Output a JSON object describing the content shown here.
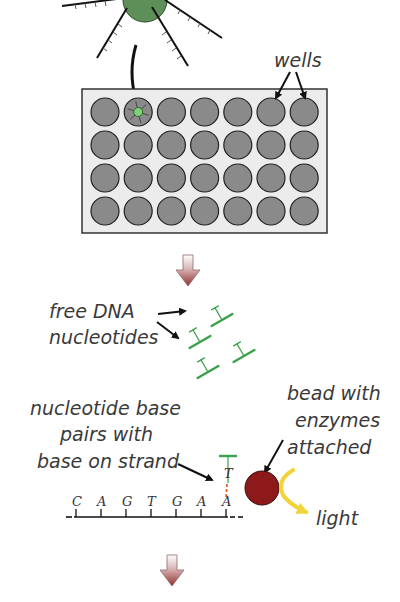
{
  "labels": {
    "wells": "wells",
    "free_dna_line1": "free DNA",
    "free_dna_line2": "nucleotides",
    "pairing_line1": "nucleotide base",
    "pairing_line2": "pairs with",
    "pairing_line3": "base on strand",
    "bead_line1": "bead with",
    "bead_line2": "enzymes",
    "bead_line3": "attached",
    "light": "light"
  },
  "strand": {
    "bases": [
      "C",
      "A",
      "G",
      "T",
      "G",
      "A",
      "A"
    ],
    "paired_base": "T"
  },
  "plate": {
    "rows": 4,
    "cols": 7,
    "highlighted_well": {
      "row": 0,
      "col": 1
    }
  },
  "colors": {
    "well_fill": "#8a8a8a",
    "plate_fill": "#ececec",
    "bead_top": "#5f8f58",
    "nucleotide_green": "#3aa04a",
    "bead_red": "#8c1a1a",
    "light_yellow": "#f0d43a",
    "arrow_red": "#9a3a3a"
  }
}
